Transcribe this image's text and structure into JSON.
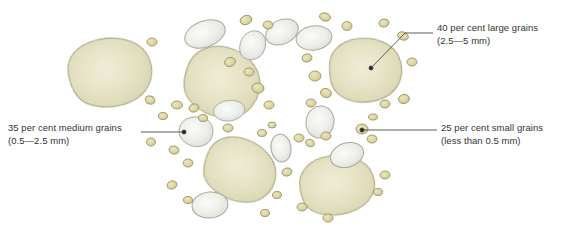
{
  "figure": {
    "background_color": "#ffffff"
  },
  "callouts": [
    {
      "id": "large",
      "line1": "40 per cent large grains",
      "line2": "(2.5—5 mm)",
      "leader": "bent-line-to-grain"
    },
    {
      "id": "medium",
      "line1": "35 per cent medium grains",
      "line2": "(0.5—2.5 mm)",
      "leader": "horizontal-line-to-grain"
    },
    {
      "id": "small",
      "line1": "25 per cent small grains",
      "line2": "(less than 0.5 mm)",
      "leader": "horizontal-line-to-grain"
    }
  ],
  "colors": {
    "large_grain_fill": "#e6e3c0",
    "large_grain_highlight": "#f2efd6",
    "large_grain_stroke": "#a9a480",
    "medium_grain_fill": "#ecedE7",
    "medium_grain_highlight": "#f8f8f4",
    "medium_grain_stroke": "#a8ab9e",
    "small_grain_fill": "#ddd6a6",
    "small_grain_stroke": "#9c9668",
    "leader_line": "#4a4a4a",
    "text": "#333333"
  },
  "grains": {
    "large": [
      {
        "cx": 110,
        "cy": 72,
        "rx": 42,
        "ry": 33,
        "rot": -12
      },
      {
        "cx": 222,
        "cy": 82,
        "rx": 38,
        "ry": 35,
        "rot": 14
      },
      {
        "cx": 365,
        "cy": 70,
        "rx": 36,
        "ry": 32,
        "rot": -6
      },
      {
        "cx": 240,
        "cy": 170,
        "rx": 38,
        "ry": 32,
        "rot": 20
      },
      {
        "cx": 337,
        "cy": 185,
        "rx": 38,
        "ry": 31,
        "rot": -10
      }
    ],
    "medium": [
      {
        "cx": 205,
        "cy": 34,
        "rx": 21,
        "ry": 13,
        "rot": -20
      },
      {
        "cx": 252,
        "cy": 45,
        "rx": 13,
        "ry": 15,
        "rot": 10
      },
      {
        "cx": 282,
        "cy": 32,
        "rx": 17,
        "ry": 12,
        "rot": -25
      },
      {
        "cx": 314,
        "cy": 38,
        "rx": 18,
        "ry": 12,
        "rot": -8
      },
      {
        "cx": 230,
        "cy": 110,
        "rx": 15,
        "ry": 10,
        "rot": -28
      },
      {
        "cx": 196,
        "cy": 132,
        "rx": 18,
        "ry": 14,
        "rot": -22
      },
      {
        "cx": 320,
        "cy": 122,
        "rx": 14,
        "ry": 16,
        "rot": 12
      },
      {
        "cx": 281,
        "cy": 148,
        "rx": 10,
        "ry": 14,
        "rot": -8
      },
      {
        "cx": 347,
        "cy": 155,
        "rx": 17,
        "ry": 12,
        "rot": -18
      },
      {
        "cx": 210,
        "cy": 205,
        "rx": 18,
        "ry": 13,
        "rot": -6
      }
    ],
    "small_count": 44
  }
}
